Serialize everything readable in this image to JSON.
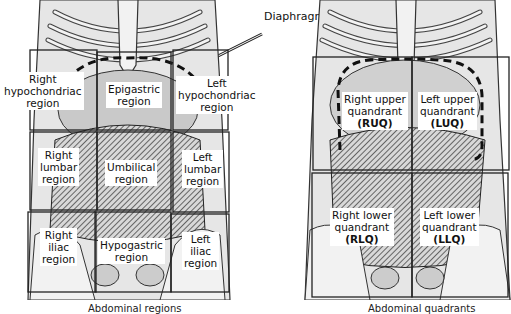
{
  "diagram": {
    "callout": "Diaphragm",
    "left_figure": {
      "title": "Abdominal regions",
      "regions": [
        {
          "id": "right-hypochondriac",
          "lines": [
            "Right",
            "hypochondriac",
            "region"
          ]
        },
        {
          "id": "epigastric",
          "lines": [
            "Epigastric",
            "region"
          ]
        },
        {
          "id": "left-hypochondriac",
          "lines": [
            "Left",
            "hypochondriac",
            "region"
          ]
        },
        {
          "id": "right-lumbar",
          "lines": [
            "Right",
            "lumbar",
            "region"
          ]
        },
        {
          "id": "umbilical",
          "lines": [
            "Umbilical",
            "region"
          ]
        },
        {
          "id": "left-lumbar",
          "lines": [
            "Left",
            "lumbar",
            "region"
          ]
        },
        {
          "id": "right-iliac",
          "lines": [
            "Right",
            "iliac",
            "region"
          ]
        },
        {
          "id": "hypogastric",
          "lines": [
            "Hypogastric",
            "region"
          ]
        },
        {
          "id": "left-iliac",
          "lines": [
            "Left",
            "iliac",
            "region"
          ]
        }
      ]
    },
    "right_figure": {
      "title": "Abdominal quadrants",
      "quadrants": [
        {
          "id": "ruq",
          "lines": [
            "Right upper",
            "quandrant",
            "(RUQ)"
          ]
        },
        {
          "id": "luq",
          "lines": [
            "Left upper",
            "quandrant",
            "(LUQ)"
          ]
        },
        {
          "id": "rlq",
          "lines": [
            "Right lower",
            "quandrant",
            "(RLQ)"
          ]
        },
        {
          "id": "llq",
          "lines": [
            "Left lower",
            "quandrant",
            "(LLQ)"
          ]
        }
      ]
    }
  }
}
